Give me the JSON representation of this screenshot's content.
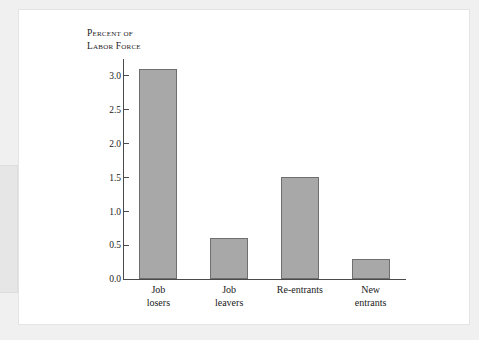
{
  "figure": {
    "y_axis_title": "Percent of\nLabor Force"
  },
  "chart_data": {
    "type": "bar",
    "title": "",
    "xlabel": "",
    "ylabel": "Percent of Labor Force",
    "categories": [
      "Job\nlosers",
      "Job\nleavers",
      "Re-entrants",
      "New\nentrants"
    ],
    "values": [
      3.1,
      0.6,
      1.5,
      0.3
    ],
    "ylim": [
      0.0,
      3.25
    ],
    "yticks": [
      "0.0",
      "0.5",
      "1.0",
      "1.5",
      "2.0",
      "2.5",
      "3.0"
    ],
    "ytick_values": [
      0.0,
      0.5,
      1.0,
      1.5,
      2.0,
      2.5,
      3.0
    ],
    "grid": false,
    "legend": "none",
    "bar_fill_color": "#a8a8a8",
    "bar_edge_color": "#6f6f6f",
    "axis_color": "#4a4a4a"
  }
}
